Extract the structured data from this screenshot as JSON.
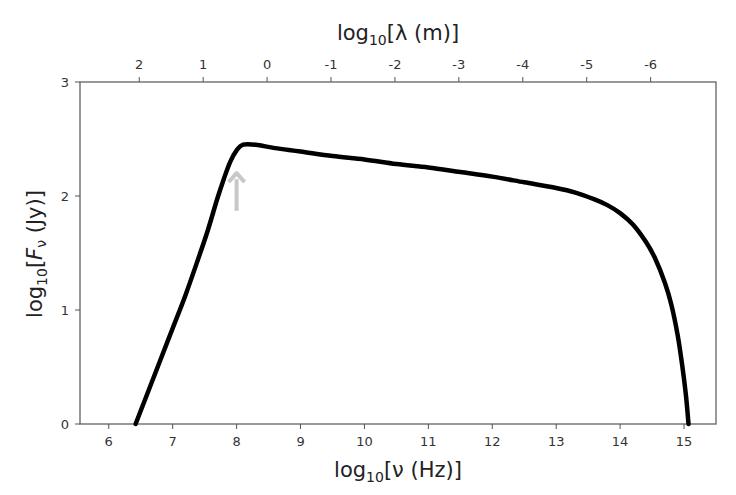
{
  "chart_data": {
    "type": "line",
    "title": "",
    "xlabel": "log10[ν (Hz)]",
    "ylabel": "log10[Fν (Jy)]",
    "top_xlabel": "log10[λ (m)]",
    "xlim": [
      5.55,
      15.5
    ],
    "ylim": [
      0,
      3
    ],
    "grid": false,
    "legend": null,
    "x_ticks": [
      6,
      7,
      8,
      9,
      10,
      11,
      12,
      13,
      14,
      15
    ],
    "y_ticks": [
      0,
      1,
      2,
      3
    ],
    "top_x_ticks": [
      {
        "label": "2",
        "nu": 6.477
      },
      {
        "label": "1",
        "nu": 7.477
      },
      {
        "label": "0",
        "nu": 8.477
      },
      {
        "label": "-1",
        "nu": 9.477
      },
      {
        "label": "-2",
        "nu": 10.477
      },
      {
        "label": "-3",
        "nu": 11.477
      },
      {
        "label": "-4",
        "nu": 12.477
      },
      {
        "label": "-5",
        "nu": 13.477
      },
      {
        "label": "-6",
        "nu": 14.477
      }
    ],
    "series": [
      {
        "name": "SED",
        "color": "#000000",
        "x": [
          6.42,
          6.8,
          7.0,
          7.2,
          7.4,
          7.55,
          7.7,
          7.8,
          7.9,
          8.0,
          8.1,
          8.3,
          8.6,
          9.0,
          9.5,
          10.0,
          10.5,
          11.0,
          11.5,
          12.0,
          12.5,
          13.0,
          13.3,
          13.6,
          13.8,
          14.0,
          14.2,
          14.4,
          14.55,
          14.7,
          14.8,
          14.9,
          14.97,
          15.03,
          15.07
        ],
        "y": [
          0.0,
          0.55,
          0.84,
          1.13,
          1.45,
          1.7,
          1.98,
          2.15,
          2.3,
          2.4,
          2.45,
          2.45,
          2.42,
          2.39,
          2.35,
          2.32,
          2.28,
          2.25,
          2.21,
          2.17,
          2.12,
          2.07,
          2.03,
          1.97,
          1.92,
          1.85,
          1.75,
          1.6,
          1.45,
          1.24,
          1.05,
          0.78,
          0.52,
          0.25,
          0.0
        ]
      }
    ],
    "annotations": [
      {
        "type": "arrow",
        "x": 8.0,
        "y_from": 1.87,
        "y_to": 2.2,
        "color": "#c8c8c8"
      }
    ]
  }
}
